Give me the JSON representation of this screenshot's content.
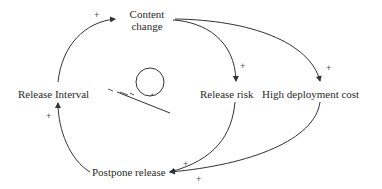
{
  "diagram": {
    "type": "causal-loop",
    "nodes": [
      {
        "id": "content-change",
        "line1": "Content",
        "line2": "change"
      },
      {
        "id": "release-interval",
        "label": "Release Interval"
      },
      {
        "id": "release-risk",
        "label": "Release risk"
      },
      {
        "id": "high-deployment-cost",
        "label": "High deployment cost"
      },
      {
        "id": "postpone-release",
        "label": "Postpone release"
      }
    ],
    "edges": [
      {
        "from": "release-interval",
        "to": "content-change",
        "polarity": "+"
      },
      {
        "from": "content-change",
        "to": "release-risk",
        "polarity": "+"
      },
      {
        "from": "content-change",
        "to": "high-deployment-cost",
        "polarity": "+"
      },
      {
        "from": "release-risk",
        "to": "postpone-release",
        "polarity": "+"
      },
      {
        "from": "high-deployment-cost",
        "to": "postpone-release",
        "polarity": "+"
      },
      {
        "from": "postpone-release",
        "to": "release-interval",
        "polarity": "+"
      }
    ],
    "loop_marker": {
      "type": "balancing",
      "label": "-"
    },
    "colors": {
      "line": "#333333",
      "text": "#2a2a2a"
    }
  }
}
